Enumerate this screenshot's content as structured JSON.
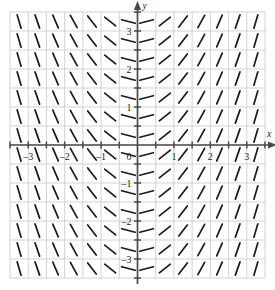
{
  "figure": {
    "title": "",
    "background_color": "#ffffff"
  },
  "chart_data": {
    "type": "scatter",
    "subtype": "slope-field",
    "title": "",
    "xlabel": "x",
    "ylabel": "y",
    "equation": "dy/dx = x",
    "xlim": [
      -3.5,
      3.5
    ],
    "ylim": [
      -3.5,
      3.5
    ],
    "grid": true,
    "grid_step": 0.5,
    "grid_color": "#c8c8c8",
    "axis_color": "#4a4a4a",
    "segment_color": "#1a1a1a",
    "legend": null,
    "legend_position": "none",
    "x_ticks": [
      -3.5,
      -3,
      -2.5,
      -2,
      -1.5,
      -1,
      -0.5,
      0,
      0.5,
      1,
      1.5,
      2,
      2.5,
      3,
      3.5
    ],
    "y_ticks": [
      -3.5,
      -3,
      -2.5,
      -2,
      -1.5,
      -1,
      -0.5,
      0,
      0.5,
      1,
      1.5,
      2,
      2.5,
      3,
      3.5
    ],
    "x_tick_labels": [
      {
        "value": -3,
        "text": "–3"
      },
      {
        "value": -2,
        "text": "–2"
      },
      {
        "value": -1,
        "text": "–1"
      },
      {
        "value": 1,
        "text": "1"
      },
      {
        "value": 2,
        "text": "2"
      },
      {
        "value": 3,
        "text": "3"
      }
    ],
    "y_tick_labels": [
      {
        "value": 3,
        "text": "3"
      },
      {
        "value": 2,
        "text": "2"
      },
      {
        "value": 1,
        "text": "1"
      },
      {
        "value": -1,
        "text": "–1"
      },
      {
        "value": -2,
        "text": "–2"
      },
      {
        "value": -3,
        "text": "–3"
      }
    ],
    "origin_label": "0",
    "sample_x": [
      -3.25,
      -2.75,
      -2.25,
      -1.75,
      -1.25,
      -0.75,
      -0.25,
      0.25,
      0.75,
      1.25,
      1.75,
      2.25,
      2.75,
      3.25
    ],
    "sample_y": [
      -3.25,
      -2.75,
      -2.25,
      -1.75,
      -1.25,
      -0.75,
      -0.25,
      0.25,
      0.75,
      1.25,
      1.75,
      2.25,
      2.75,
      3.25
    ],
    "slopes_by_x": [
      {
        "x": -3.25,
        "slope": -3.25
      },
      {
        "x": -2.75,
        "slope": -2.75
      },
      {
        "x": -2.25,
        "slope": -2.25
      },
      {
        "x": -1.75,
        "slope": -1.75
      },
      {
        "x": -1.25,
        "slope": -1.25
      },
      {
        "x": -0.75,
        "slope": -0.75
      },
      {
        "x": -0.25,
        "slope": -0.25
      },
      {
        "x": 0.25,
        "slope": 0.25
      },
      {
        "x": 0.75,
        "slope": 0.75
      },
      {
        "x": 1.25,
        "slope": 1.25
      },
      {
        "x": 1.75,
        "slope": 1.75
      },
      {
        "x": 2.25,
        "slope": 2.25
      },
      {
        "x": 2.75,
        "slope": 2.75
      },
      {
        "x": 3.25,
        "slope": 3.25
      }
    ]
  },
  "axes": {
    "x_axis_arrow_label": "x",
    "y_axis_arrow_label": "y"
  }
}
